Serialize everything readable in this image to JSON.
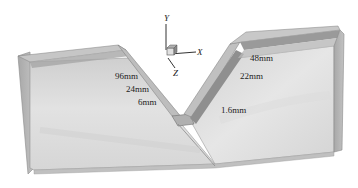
{
  "figure": {
    "axes": {
      "x_label": "X",
      "y_label": "Y",
      "z_label": "Z"
    },
    "annotations": [
      {
        "id": "left_96",
        "text": "96mm"
      },
      {
        "id": "left_24",
        "text": "24mm"
      },
      {
        "id": "left_6",
        "text": "6mm"
      },
      {
        "id": "right_48",
        "text": "48mm"
      },
      {
        "id": "right_22",
        "text": "22mm"
      },
      {
        "id": "right_1_6",
        "text": "1.6mm"
      }
    ],
    "colors": {
      "background": "#ffffff",
      "plate_front": "#d9d9d9",
      "plate_front_light": "#e8e8e8",
      "plate_top": "#c4c4c4",
      "band_dark": "#9a9a9a",
      "side_face": "#b5b5b5",
      "edge": "#7a7a7a"
    }
  }
}
